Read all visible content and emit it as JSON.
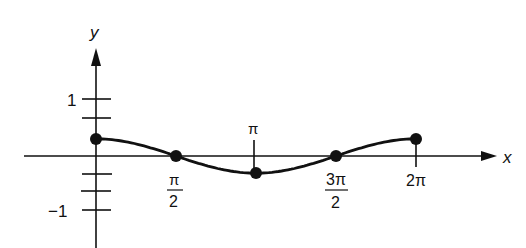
{
  "chart_data": {
    "type": "line",
    "title": "",
    "xlabel": "x",
    "ylabel": "y",
    "function_hint": "y = 0.3 cos x",
    "x_ticks": [
      {
        "value": 1.5708,
        "label_num": "π",
        "label_den": "2"
      },
      {
        "value": 3.1416,
        "label": "π",
        "position": "above"
      },
      {
        "value": 4.7124,
        "label_num": "3π",
        "label_den": "2"
      },
      {
        "value": 6.2832,
        "label": "2π"
      }
    ],
    "y_ticks": [
      {
        "value": 1,
        "label": "1"
      },
      {
        "value": 0.67,
        "label": ""
      },
      {
        "value": 0.33,
        "label": ""
      },
      {
        "value": -0.33,
        "label": ""
      },
      {
        "value": -0.67,
        "label": ""
      },
      {
        "value": -1,
        "label": "−1"
      }
    ],
    "points": [
      {
        "x": 0,
        "y": 0.3
      },
      {
        "x": 1.5708,
        "y": 0
      },
      {
        "x": 3.1416,
        "y": -0.3
      },
      {
        "x": 4.7124,
        "y": 0
      },
      {
        "x": 6.2832,
        "y": 0.3
      }
    ],
    "xlim": [
      0,
      6.2832
    ],
    "ylim": [
      -1.2,
      1.6
    ],
    "grid": false,
    "legend": null
  },
  "labels": {
    "x_axis": "x",
    "y_axis": "y",
    "y_one": "1",
    "y_minus_one": "−1",
    "pi_half_num": "π",
    "pi_half_den": "2",
    "pi": "π",
    "three_pi_half_num": "3π",
    "three_pi_half_den": "2",
    "two_pi": "2π"
  }
}
